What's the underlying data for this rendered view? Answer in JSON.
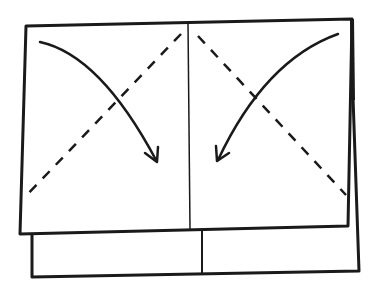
{
  "diagram": {
    "type": "folding-instruction",
    "colors": {
      "background": "#ffffff",
      "stroke": "#1a1a1a"
    },
    "elements": {
      "front_sheet": {
        "label": "front-sheet"
      },
      "back_sheet": {
        "label": "back-sheet"
      },
      "center_crease": {
        "label": "center-crease"
      },
      "left_fold_line": {
        "style": "dashed",
        "direction": "top-center to bottom-left"
      },
      "right_fold_line": {
        "style": "dashed",
        "direction": "top-center to bottom-right"
      },
      "left_arrow": {
        "direction": "curved, top-left corner down to center"
      },
      "right_arrow": {
        "direction": "curved, top-right corner down to center"
      }
    }
  }
}
